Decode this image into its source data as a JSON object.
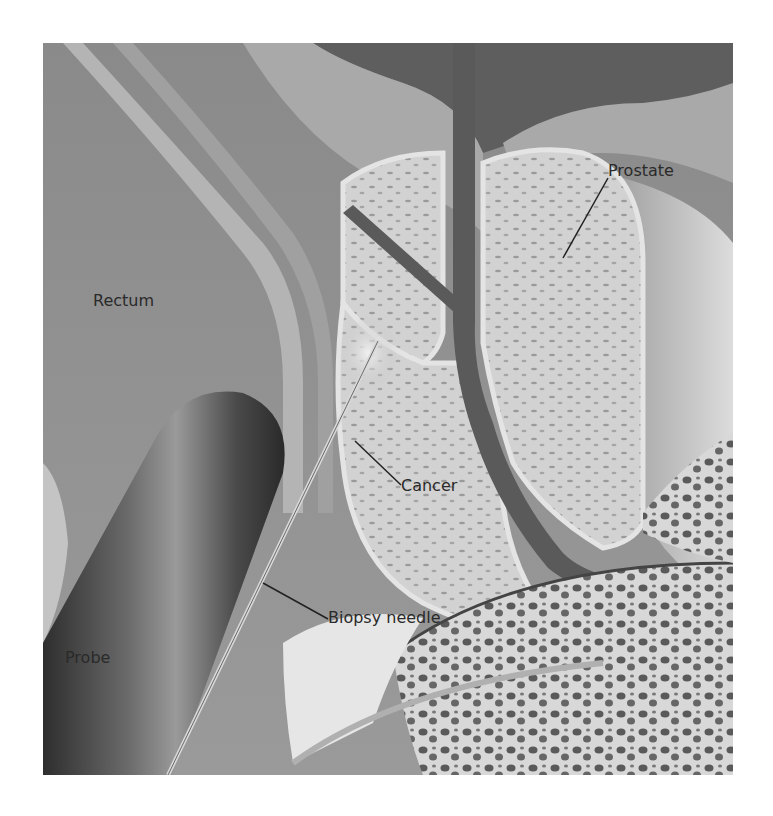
{
  "figure": {
    "labels": {
      "prostate": "Prostate",
      "rectum": "Rectum",
      "cancer": "Cancer",
      "biopsy_needle": "Biopsy needle",
      "probe": "Probe"
    },
    "colors": {
      "background": "#ffffff",
      "tissue_mid": "#8c8c8c",
      "tissue_light": "#c8c8c8",
      "tissue_dark": "#555555",
      "probe_dark": "#3a3a3a",
      "label_text": "#2a2a2a"
    }
  }
}
